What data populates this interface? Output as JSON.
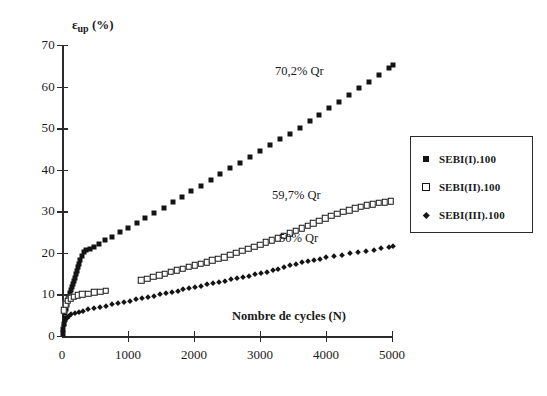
{
  "chart_data": {
    "type": "scatter",
    "title": "",
    "xlabel": "Nombre de cycles (N)",
    "ylabel_main": "ε",
    "ylabel_sub": "up",
    "ylabel_unit": " (%)",
    "xlim": [
      0,
      5000
    ],
    "ylim": [
      0,
      70
    ],
    "xticks": [
      0,
      1000,
      2000,
      3000,
      4000,
      5000
    ],
    "yticks": [
      0,
      10,
      20,
      30,
      40,
      50,
      60,
      70
    ],
    "grid": false,
    "legend_position": "right-outside",
    "annotations": [
      {
        "text": "70,2% Qr",
        "x": 3150,
        "y": 62,
        "series": "SEBI(I).100"
      },
      {
        "text": "59,7% Qr",
        "x": 3100,
        "y": 35.5,
        "series": "SEBI(II).100"
      },
      {
        "text": "50% Qr",
        "x": 3200,
        "y": 24.5,
        "series": "SEBI(III).100"
      }
    ],
    "series": [
      {
        "name": "SEBI(I).100",
        "marker": "filled-square",
        "color": "#141414",
        "points": [
          [
            10,
            0.4
          ],
          [
            20,
            1.6
          ],
          [
            30,
            3.0
          ],
          [
            40,
            4.4
          ],
          [
            50,
            5.6
          ],
          [
            60,
            6.6
          ],
          [
            70,
            7.4
          ],
          [
            80,
            8.2
          ],
          [
            90,
            8.9
          ],
          [
            100,
            9.5
          ],
          [
            115,
            10.3
          ],
          [
            130,
            11.0
          ],
          [
            145,
            11.7
          ],
          [
            160,
            12.4
          ],
          [
            175,
            13.2
          ],
          [
            190,
            14.0
          ],
          [
            205,
            14.8
          ],
          [
            220,
            15.6
          ],
          [
            240,
            16.5
          ],
          [
            260,
            17.4
          ],
          [
            280,
            18.4
          ],
          [
            300,
            19.3
          ],
          [
            330,
            20.1
          ],
          [
            370,
            20.6
          ],
          [
            420,
            21.0
          ],
          [
            480,
            21.5
          ],
          [
            560,
            22.2
          ],
          [
            650,
            23.0
          ],
          [
            760,
            23.9
          ],
          [
            880,
            24.9
          ],
          [
            1000,
            26.0
          ],
          [
            1130,
            27.1
          ],
          [
            1260,
            28.3
          ],
          [
            1400,
            29.6
          ],
          [
            1540,
            30.9
          ],
          [
            1680,
            32.2
          ],
          [
            1820,
            33.5
          ],
          [
            1960,
            34.8
          ],
          [
            2100,
            36.1
          ],
          [
            2250,
            37.5
          ],
          [
            2400,
            38.9
          ],
          [
            2550,
            40.3
          ],
          [
            2700,
            41.7
          ],
          [
            2850,
            43.1
          ],
          [
            3000,
            44.5
          ],
          [
            3150,
            45.9
          ],
          [
            3300,
            47.3
          ],
          [
            3450,
            48.7
          ],
          [
            3600,
            50.1
          ],
          [
            3750,
            51.6
          ],
          [
            3900,
            53.2
          ],
          [
            4050,
            54.8
          ],
          [
            4200,
            56.4
          ],
          [
            4350,
            58.0
          ],
          [
            4500,
            59.6
          ],
          [
            4650,
            61.2
          ],
          [
            4800,
            62.8
          ],
          [
            4950,
            64.4
          ],
          [
            5020,
            65.1
          ]
        ]
      },
      {
        "name": "SEBI(II).100",
        "marker": "open-square",
        "color": "#141414",
        "points": [
          [
            25,
            6.2
          ],
          [
            55,
            7.6
          ],
          [
            90,
            8.5
          ],
          [
            130,
            9.1
          ],
          [
            180,
            9.5
          ],
          [
            240,
            9.8
          ],
          [
            310,
            10.0
          ],
          [
            400,
            10.2
          ],
          [
            490,
            10.5
          ],
          [
            580,
            10.7
          ],
          [
            660,
            10.9
          ],
          [
            1200,
            13.4
          ],
          [
            1290,
            13.8
          ],
          [
            1380,
            14.2
          ],
          [
            1470,
            14.6
          ],
          [
            1560,
            15.0
          ],
          [
            1650,
            15.4
          ],
          [
            1740,
            15.8
          ],
          [
            1830,
            16.2
          ],
          [
            1920,
            16.6
          ],
          [
            2010,
            17.0
          ],
          [
            2100,
            17.4
          ],
          [
            2190,
            17.8
          ],
          [
            2280,
            18.2
          ],
          [
            2370,
            18.6
          ],
          [
            2460,
            19.0
          ],
          [
            2550,
            19.5
          ],
          [
            2640,
            20.0
          ],
          [
            2730,
            20.5
          ],
          [
            2820,
            21.0
          ],
          [
            2910,
            21.5
          ],
          [
            3000,
            22.0
          ],
          [
            3090,
            22.5
          ],
          [
            3180,
            23.0
          ],
          [
            3270,
            23.5
          ],
          [
            3360,
            24.1
          ],
          [
            3450,
            24.7
          ],
          [
            3540,
            25.3
          ],
          [
            3630,
            25.9
          ],
          [
            3720,
            26.5
          ],
          [
            3810,
            27.1
          ],
          [
            3900,
            27.7
          ],
          [
            3990,
            28.3
          ],
          [
            4080,
            28.9
          ],
          [
            4170,
            29.4
          ],
          [
            4260,
            29.9
          ],
          [
            4350,
            30.3
          ],
          [
            4440,
            30.7
          ],
          [
            4530,
            31.1
          ],
          [
            4620,
            31.4
          ],
          [
            4710,
            31.7
          ],
          [
            4800,
            32.0
          ],
          [
            4890,
            32.2
          ],
          [
            4980,
            32.4
          ]
        ]
      },
      {
        "name": "SEBI(III).100",
        "marker": "diamond",
        "color": "#141414",
        "points": [
          [
            10,
            1.2
          ],
          [
            25,
            2.6
          ],
          [
            45,
            3.6
          ],
          [
            70,
            4.3
          ],
          [
            100,
            4.8
          ],
          [
            140,
            5.2
          ],
          [
            190,
            5.5
          ],
          [
            250,
            5.8
          ],
          [
            320,
            6.1
          ],
          [
            400,
            6.4
          ],
          [
            490,
            6.7
          ],
          [
            580,
            7.0
          ],
          [
            670,
            7.3
          ],
          [
            760,
            7.6
          ],
          [
            850,
            7.9
          ],
          [
            940,
            8.2
          ],
          [
            1030,
            8.5
          ],
          [
            1120,
            8.8
          ],
          [
            1210,
            9.1
          ],
          [
            1300,
            9.4
          ],
          [
            1390,
            9.7
          ],
          [
            1480,
            10.0
          ],
          [
            1570,
            10.3
          ],
          [
            1660,
            10.6
          ],
          [
            1750,
            10.9
          ],
          [
            1840,
            11.2
          ],
          [
            1930,
            11.5
          ],
          [
            2020,
            11.8
          ],
          [
            2110,
            12.1
          ],
          [
            2200,
            12.4
          ],
          [
            2290,
            12.7
          ],
          [
            2380,
            13.0
          ],
          [
            2470,
            13.3
          ],
          [
            2560,
            13.6
          ],
          [
            2650,
            13.9
          ],
          [
            2740,
            14.2
          ],
          [
            2830,
            14.5
          ],
          [
            2920,
            14.8
          ],
          [
            3010,
            15.1
          ],
          [
            3100,
            15.4
          ],
          [
            3190,
            15.8
          ],
          [
            3280,
            16.2
          ],
          [
            3370,
            16.6
          ],
          [
            3460,
            17.0
          ],
          [
            3550,
            17.4
          ],
          [
            3640,
            17.7
          ],
          [
            3730,
            18.0
          ],
          [
            3820,
            18.3
          ],
          [
            3910,
            18.6
          ],
          [
            4000,
            18.9
          ],
          [
            4120,
            19.3
          ],
          [
            4240,
            19.6
          ],
          [
            4360,
            19.9
          ],
          [
            4480,
            20.2
          ],
          [
            4600,
            20.5
          ],
          [
            4720,
            20.8
          ],
          [
            4840,
            21.1
          ],
          [
            4960,
            21.4
          ],
          [
            5020,
            21.6
          ]
        ]
      }
    ]
  },
  "legend": {
    "entries": [
      {
        "label": "SEBI(I).100",
        "marker": "filled-square"
      },
      {
        "label": "SEBI(II).100",
        "marker": "open-square"
      },
      {
        "label": "SEBI(III).100",
        "marker": "diamond"
      }
    ]
  }
}
